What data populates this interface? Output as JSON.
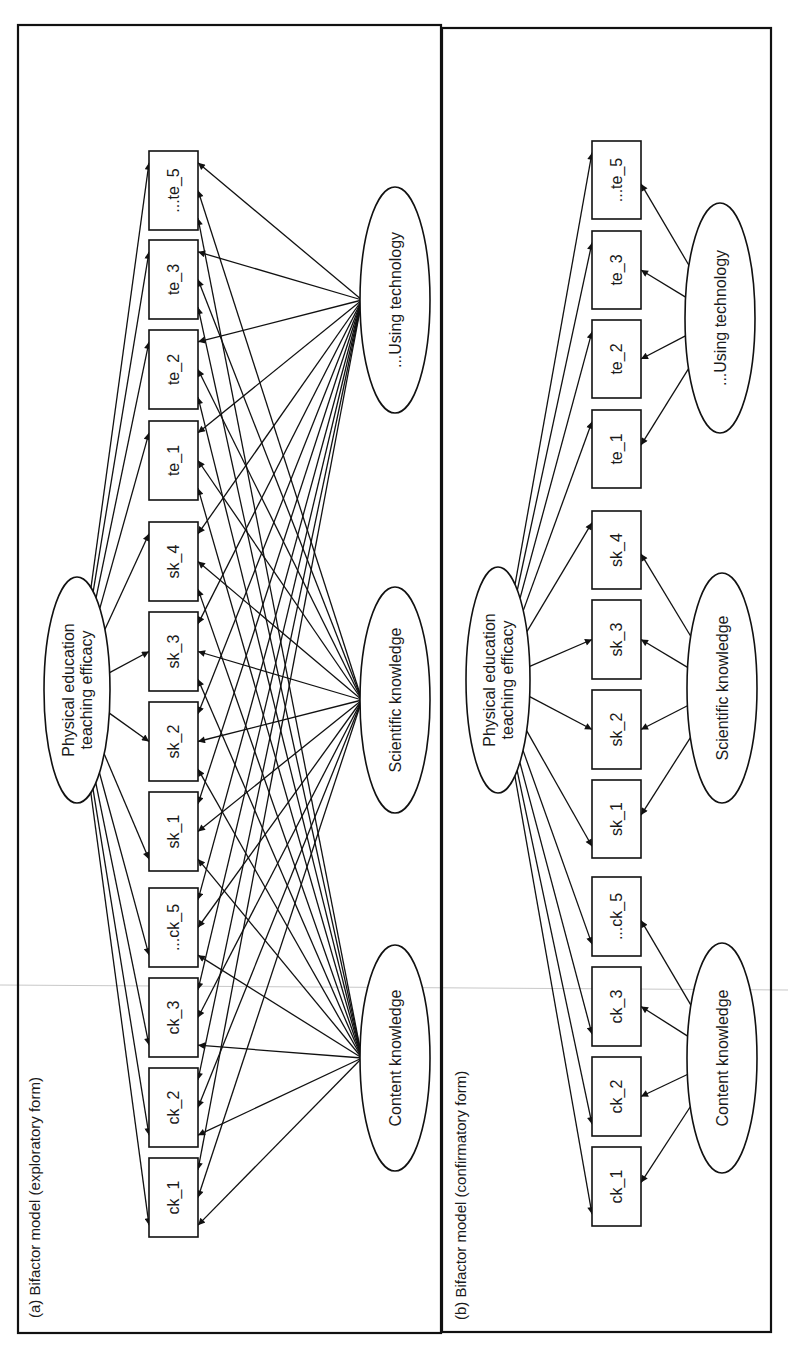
{
  "figure": {
    "panels": [
      {
        "id": "a",
        "label": "(a) Bifactor model (exploratory form)",
        "form": "exploratory",
        "frame": {
          "x": 18,
          "y": 25,
          "w": 423,
          "h": 1308
        },
        "label_pos": {
          "x": 36,
          "y": 1318
        },
        "general_factor": {
          "id": "pete",
          "lines": [
            "Physical education",
            "teaching efficacy"
          ],
          "cx": 77,
          "cy": 690,
          "rx": 33,
          "ry": 113
        },
        "box_x": 149,
        "box_w": 49,
        "items": [
          {
            "id": "te_5",
            "label": "...te_5",
            "y": 151,
            "h": 79,
            "group": "tech"
          },
          {
            "id": "te_3",
            "label": "te_3",
            "y": 240,
            "h": 79,
            "group": "tech"
          },
          {
            "id": "te_2",
            "label": "te_2",
            "y": 330,
            "h": 79,
            "group": "tech"
          },
          {
            "id": "te_1",
            "label": "te_1",
            "y": 421,
            "h": 79,
            "group": "tech"
          },
          {
            "id": "sk_4",
            "label": "sk_4",
            "y": 522,
            "h": 79,
            "group": "sci"
          },
          {
            "id": "sk_3",
            "label": "sk_3",
            "y": 612,
            "h": 79,
            "group": "sci"
          },
          {
            "id": "sk_2",
            "label": "sk_2",
            "y": 702,
            "h": 79,
            "group": "sci"
          },
          {
            "id": "sk_1",
            "label": "sk_1",
            "y": 792,
            "h": 79,
            "group": "sci"
          },
          {
            "id": "ck_5",
            "label": "...ck_5",
            "y": 888,
            "h": 79,
            "group": "content"
          },
          {
            "id": "ck_3",
            "label": "ck_3",
            "y": 978,
            "h": 79,
            "group": "content"
          },
          {
            "id": "ck_2",
            "label": "ck_2",
            "y": 1068,
            "h": 79,
            "group": "content"
          },
          {
            "id": "ck_1",
            "label": "ck_1",
            "y": 1158,
            "h": 79,
            "group": "content"
          }
        ],
        "specific_factors": [
          {
            "id": "tech",
            "label": "...Using technology",
            "cx": 395,
            "cy": 300,
            "rx": 35,
            "ry": 113
          },
          {
            "id": "sci",
            "label": "Scientific knowledge",
            "cx": 395,
            "cy": 700,
            "rx": 35,
            "ry": 113
          },
          {
            "id": "content",
            "label": "Content knowledge",
            "cx": 395,
            "cy": 1058,
            "rx": 35,
            "ry": 113
          }
        ]
      },
      {
        "id": "b",
        "label": "(b) Bifactor model (confirmatory form)",
        "form": "confirmatory",
        "frame": {
          "x": 442,
          "y": 28,
          "w": 329,
          "h": 1304
        },
        "label_pos": {
          "x": 462,
          "y": 1320
        },
        "general_factor": {
          "id": "pete",
          "lines": [
            "Physical education",
            "teaching efficacy"
          ],
          "cx": 498,
          "cy": 680,
          "rx": 32,
          "ry": 113
        },
        "box_x": 592,
        "box_w": 49,
        "items": [
          {
            "id": "te_5",
            "label": "...te_5",
            "y": 141,
            "h": 78,
            "group": "tech"
          },
          {
            "id": "te_3",
            "label": "te_3",
            "y": 231,
            "h": 78,
            "group": "tech"
          },
          {
            "id": "te_2",
            "label": "te_2",
            "y": 320,
            "h": 78,
            "group": "tech"
          },
          {
            "id": "te_1",
            "label": "te_1",
            "y": 410,
            "h": 78,
            "group": "tech"
          },
          {
            "id": "sk_4",
            "label": "sk_4",
            "y": 511,
            "h": 78,
            "group": "sci"
          },
          {
            "id": "sk_3",
            "label": "sk_3",
            "y": 600,
            "h": 79,
            "group": "sci"
          },
          {
            "id": "sk_2",
            "label": "sk_2",
            "y": 690,
            "h": 79,
            "group": "sci"
          },
          {
            "id": "sk_1",
            "label": "sk_1",
            "y": 780,
            "h": 78,
            "group": "sci"
          },
          {
            "id": "ck_5",
            "label": "...ck_5",
            "y": 877,
            "h": 79,
            "group": "content"
          },
          {
            "id": "ck_3",
            "label": "ck_3",
            "y": 967,
            "h": 79,
            "group": "content"
          },
          {
            "id": "ck_2",
            "label": "ck_2",
            "y": 1057,
            "h": 79,
            "group": "content"
          },
          {
            "id": "ck_1",
            "label": "ck_1",
            "y": 1147,
            "h": 79,
            "group": "content"
          }
        ],
        "specific_factors": [
          {
            "id": "tech",
            "label": "...Using technology",
            "cx": 720,
            "cy": 318,
            "rx": 35,
            "ry": 115
          },
          {
            "id": "sci",
            "label": "Scientific knowledge",
            "cx": 722,
            "cy": 688,
            "rx": 35,
            "ry": 115
          },
          {
            "id": "content",
            "label": "Content knowledge",
            "cx": 722,
            "cy": 1058,
            "rx": 35,
            "ry": 115
          }
        ]
      }
    ],
    "scan_artifact_line": {
      "y1": 985,
      "y2": 990
    }
  }
}
